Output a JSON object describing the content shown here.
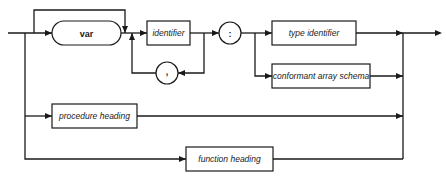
{
  "diagram": {
    "type": "syntax-diagram",
    "nodes": {
      "var": {
        "label": "var",
        "shape": "rounded-terminal"
      },
      "identifier": {
        "label": "identifier",
        "shape": "box"
      },
      "colon": {
        "label": ":",
        "shape": "circle"
      },
      "comma": {
        "label": ",",
        "shape": "circle"
      },
      "type_identifier": {
        "label": "type identifier",
        "shape": "box"
      },
      "conformant_array_schema": {
        "label": "conformant array schema",
        "shape": "box"
      },
      "procedure_heading": {
        "label": "procedure heading",
        "shape": "box"
      },
      "function_heading": {
        "label": "function heading",
        "shape": "box"
      }
    },
    "edges": [
      {
        "from": "entry",
        "to": "var"
      },
      {
        "from": "entry",
        "to": "identifier",
        "note": "bypass var"
      },
      {
        "from": "var",
        "to": "identifier"
      },
      {
        "from": "identifier",
        "to": "colon"
      },
      {
        "from": "identifier",
        "to": "comma",
        "note": "loop"
      },
      {
        "from": "comma",
        "to": "identifier"
      },
      {
        "from": "colon",
        "to": "type_identifier"
      },
      {
        "from": "colon",
        "to": "conformant_array_schema"
      },
      {
        "from": "type_identifier",
        "to": "exit"
      },
      {
        "from": "conformant_array_schema",
        "to": "exit"
      },
      {
        "from": "entry",
        "to": "procedure_heading"
      },
      {
        "from": "procedure_heading",
        "to": "exit"
      },
      {
        "from": "entry",
        "to": "function_heading"
      },
      {
        "from": "function_heading",
        "to": "exit"
      }
    ],
    "colors": {
      "ink": "#1a1a1a",
      "background": "#ffffff"
    }
  }
}
